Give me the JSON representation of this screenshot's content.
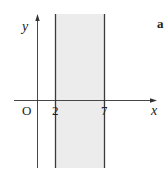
{
  "figure": {
    "panel_label": "a",
    "axes": {
      "x_label": "x",
      "y_label": "y",
      "origin_label": "O"
    },
    "ticks": [
      "2",
      "7"
    ],
    "region": {
      "description": "shaded vertical strip 2 < x < 7",
      "x_min": 2,
      "x_max": 7,
      "fill_color": "#ececec",
      "boundary_color": "#3a3a3a"
    },
    "axis_color": "#333333"
  }
}
